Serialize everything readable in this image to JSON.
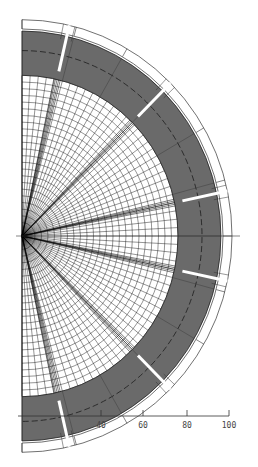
{
  "diagram": {
    "type": "semicircular polar mesh cross-section",
    "center": {
      "x": 22,
      "y": 236
    },
    "y_scale": 1.03,
    "mesh": {
      "outer_radius": 156,
      "ring_spacing": 6.5,
      "radial_step_deg": 3,
      "line_color": "#111111"
    },
    "shaded_band": {
      "inner_radius": 156,
      "outer_radius": 199,
      "dashed_radius": 180,
      "fill": "#6a6a6a"
    },
    "outer_ring": {
      "inner_radius": 201,
      "outer_radius": 210,
      "division_step_deg": 15
    },
    "slits_deg": [
      77,
      45,
      12,
      -12,
      -45,
      -77
    ],
    "axis": {
      "y": 416,
      "ticks": [
        {
          "value": 40,
          "x": 101,
          "label": "40"
        },
        {
          "value": 60,
          "x": 143,
          "label": "60"
        },
        {
          "value": 80,
          "x": 187,
          "label": "80"
        },
        {
          "value": 100,
          "x": 229,
          "label": "100"
        }
      ]
    }
  }
}
